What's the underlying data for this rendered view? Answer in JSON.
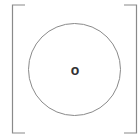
{
  "diagram": {
    "type": "matrix-bracket-circle",
    "center_label": "o",
    "colors": {
      "bracket": "#8a8a8a",
      "circle": "#8a8a8a",
      "label": "#333333",
      "background": "#ffffff"
    }
  }
}
